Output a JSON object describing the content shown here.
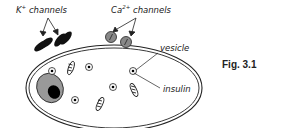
{
  "labels": {
    "k_channels_ion": "K",
    "k_channels_charge": "+",
    "k_channels_text": " channels",
    "ca_channels_ion": "Ca",
    "ca_channels_charge": "2+",
    "ca_channels_text": " channels",
    "vesicle": "vesicle",
    "insulin": "insulin"
  },
  "figure_label": "Fig. 3.1",
  "colors": {
    "outline": "#222222",
    "k_channel_fill": "#111111",
    "ca_channel_fill": "#888888",
    "nucleus_fill": "#999999",
    "nucleolus_fill": "#000000"
  }
}
